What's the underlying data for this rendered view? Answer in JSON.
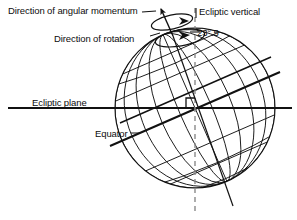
{
  "figure": {
    "background_color": "#ffffff",
    "line_color": "#111111",
    "dash_color": "#8a8a8a",
    "width": 297,
    "height": 220
  },
  "labels": {
    "angular_momentum": "Direction of angular momentum",
    "rotation": "Direction of rotation",
    "ecliptic_vertical": "Ecliptic vertical",
    "tilt_angle": "23°.5",
    "ecliptic_plane": "Ecliptic plane",
    "equator": "Equator"
  },
  "diagram_data": {
    "type": "schematic",
    "sphere": {
      "center_x": 195,
      "center_y": 108,
      "radius": 80,
      "meridian_count": 9,
      "parallel_count": 7
    },
    "axial_tilt_degrees": 23.5,
    "axis": {
      "name": "rotation-axis",
      "north_pole_x": 173,
      "north_pole_y": 35,
      "south_end_x": 232,
      "south_end_y": 205
    },
    "ecliptic_vertical": {
      "style": "dashed",
      "x": 195,
      "top_y": 8,
      "bottom_y": 210
    },
    "ecliptic_plane": {
      "style": "solid-horizontal",
      "y": 108,
      "x_start": 8,
      "x_end": 290
    },
    "equator": {
      "style": "solid-tilted",
      "tilt_degrees": 23.5
    },
    "right_angle_marker": {
      "present": true,
      "x": 195,
      "y": 108
    },
    "rotation_arrows": {
      "count": 2,
      "sense": "counterclockwise-ellipse-around-axis"
    }
  }
}
